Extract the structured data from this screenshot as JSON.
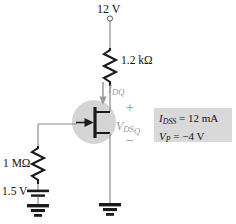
{
  "diagram": {
    "supply": {
      "label": "12 V",
      "terminal_icon": "open-circle-terminal"
    },
    "drain_resistor": {
      "label": "1.2 kΩ",
      "value": "1.2",
      "unit": "kΩ"
    },
    "gate_resistor": {
      "label": "1 MΩ",
      "value": "1",
      "unit": "MΩ"
    },
    "gate_source": {
      "label": "1.5 V",
      "value": "1.5",
      "unit": "V"
    },
    "current": {
      "symbol": "I",
      "subscript": "DQ",
      "arrow_icon": "down-arrow-icon",
      "direction": "down"
    },
    "voltage": {
      "symbol": "V",
      "subscript": "DS",
      "subscript2": "Q",
      "plus": "+",
      "minus": "−"
    },
    "device": {
      "type": "n-channel-jfet",
      "gate_icon": "gate-arrow-icon",
      "highlight_color": "#d4d4d4"
    },
    "specs": {
      "line1_symbol": "I",
      "line1_sub": "DSS",
      "line1_value": "= 12 mA",
      "line2_symbol": "V",
      "line2_sub": "P",
      "line2_value": "= −4 V",
      "box_color": "#d9d9d9"
    },
    "grounds": [
      {
        "name": "source-ground",
        "icon": "ground-icon"
      },
      {
        "name": "gate-ground",
        "icon": "ground-icon"
      }
    ],
    "colors": {
      "wire": "#6f6f6f",
      "component": "#1a1a1a",
      "annotation_gray": "#9a9a9a",
      "highlight": "#d4d4d4",
      "spec_bg": "#d9d9d9"
    }
  }
}
